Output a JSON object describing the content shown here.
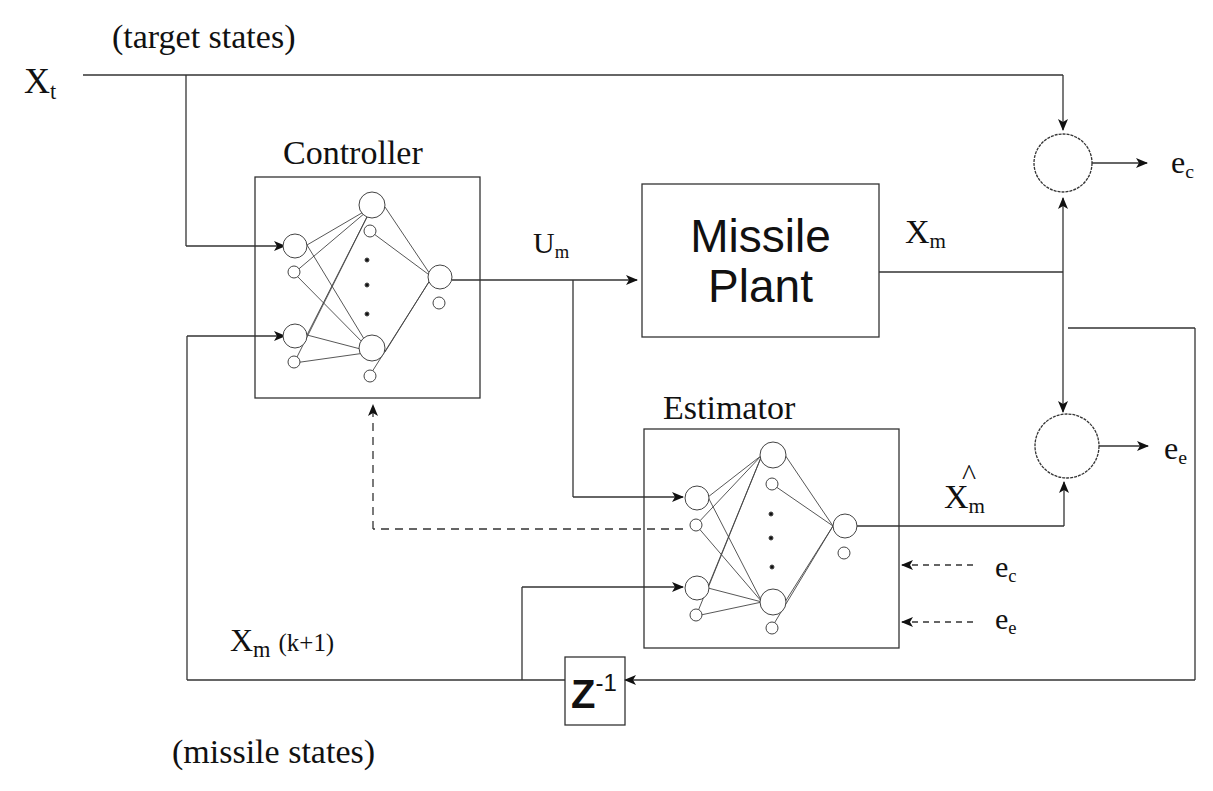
{
  "diagram": {
    "type": "block-diagram",
    "labels": {
      "target_states": "(target states)",
      "xt_main": "X",
      "xt_sub": "t",
      "controller": "Controller",
      "um_main": "U",
      "um_sub": "m",
      "plant_line1": "Missile",
      "plant_line2": "Plant",
      "xm_main": "X",
      "xm_sub": "m",
      "ec_main": "e",
      "ec_sub": "c",
      "ee_main": "e",
      "ee_sub": "e",
      "estimator": "Estimator",
      "xhat_hat": "^",
      "xhat_main": "X",
      "xhat_sub": "m",
      "ec_in_main": "e",
      "ec_in_sub": "c",
      "ee_in_main": "e",
      "ee_in_sub": "e",
      "xmk_main": "X",
      "xmk_sub": "m",
      "xmk_suffix": "(k+1)",
      "delay_main": "Z",
      "delay_sup": "-1",
      "missile_states": "(missile states)"
    },
    "nodes": [
      "Controller (neural net)",
      "Missile Plant",
      "Estimator (neural net)",
      "Summing junction e_c",
      "Summing junction e_e",
      "Unit delay Z^-1"
    ],
    "edges": [
      {
        "from": "X_t",
        "to": "Controller"
      },
      {
        "from": "X_t",
        "to": "Summing junction e_c"
      },
      {
        "from": "Controller",
        "to": "Missile Plant",
        "label": "U_m"
      },
      {
        "from": "Controller",
        "to": "Estimator",
        "label": "U_m"
      },
      {
        "from": "Missile Plant",
        "to": "Summing junction e_c",
        "label": "X_m"
      },
      {
        "from": "Missile Plant",
        "to": "Summing junction e_e",
        "label": "X_m"
      },
      {
        "from": "Missile Plant",
        "to": "Z^-1"
      },
      {
        "from": "Estimator",
        "to": "Summing junction e_e",
        "label": "X̂_m"
      },
      {
        "from": "Estimator",
        "to": "Controller",
        "style": "dashed"
      },
      {
        "from": "e_c",
        "to": "Estimator",
        "style": "dashed"
      },
      {
        "from": "e_e",
        "to": "Estimator",
        "style": "dashed"
      },
      {
        "from": "Z^-1",
        "to": "Controller",
        "label": "X_m(k+1)"
      },
      {
        "from": "Z^-1",
        "to": "Estimator"
      }
    ]
  }
}
